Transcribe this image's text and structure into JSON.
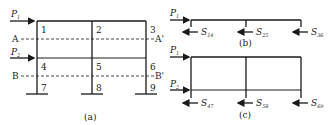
{
  "figure_a": {
    "caption": "(a)",
    "nodes": [
      "1",
      "2",
      "3",
      "4",
      "5",
      "6",
      "7",
      "8",
      "9"
    ],
    "loads": [
      {
        "symbol": "P",
        "sub": "1"
      },
      {
        "symbol": "P",
        "sub": "2"
      }
    ],
    "sections": [
      {
        "left": "A",
        "right": "A'"
      },
      {
        "left": "B",
        "right": "B'"
      }
    ]
  },
  "figure_b": {
    "caption": "(b)",
    "load": {
      "symbol": "P",
      "sub": "1"
    },
    "shears": [
      {
        "symbol": "S",
        "sub": "14"
      },
      {
        "symbol": "S",
        "sub": "25"
      },
      {
        "symbol": "S",
        "sub": "36"
      }
    ]
  },
  "figure_c": {
    "caption": "(c)",
    "loads": [
      {
        "symbol": "P",
        "sub": "1"
      },
      {
        "symbol": "P",
        "sub": "2"
      }
    ],
    "shears": [
      {
        "symbol": "S",
        "sub": "47"
      },
      {
        "symbol": "S",
        "sub": "58"
      },
      {
        "symbol": "S",
        "sub": "69"
      }
    ]
  },
  "colors": {
    "line": "#1a1a1a",
    "text": "#222222"
  }
}
